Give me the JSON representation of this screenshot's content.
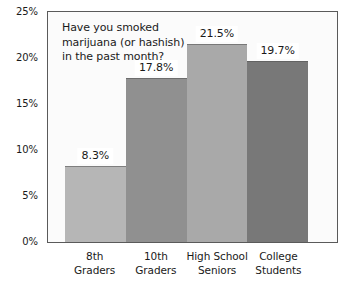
{
  "chart_data": {
    "type": "bar",
    "title_lines": [
      "Have you smoked",
      "marijuana (or hashish)",
      "in the past month?"
    ],
    "categories": [
      "8th Graders",
      "10th Graders",
      "High School Seniors",
      "College Students"
    ],
    "category_lines": [
      [
        "8th",
        "Graders"
      ],
      [
        "10th",
        "Graders"
      ],
      [
        "High School",
        "Seniors"
      ],
      [
        "College",
        "Students"
      ]
    ],
    "values": [
      8.3,
      17.8,
      21.5,
      19.7
    ],
    "value_labels": [
      "8.3%",
      "17.8%",
      "21.5%",
      "19.7%"
    ],
    "bar_colors": [
      "#b6b6b6",
      "#909090",
      "#a9a9a9",
      "#787878"
    ],
    "xlabel": "",
    "ylabel": "",
    "ylim": [
      0,
      25
    ],
    "ytick_values": [
      0,
      5,
      10,
      15,
      20,
      25
    ],
    "ytick_labels": [
      "0%",
      "5%",
      "10%",
      "15%",
      "20%",
      "25%"
    ],
    "grid": false,
    "legend": false,
    "plot_background": "#fbfbfb",
    "frame_color": "#5a5a5a",
    "text_color": "#1a1a1a"
  }
}
